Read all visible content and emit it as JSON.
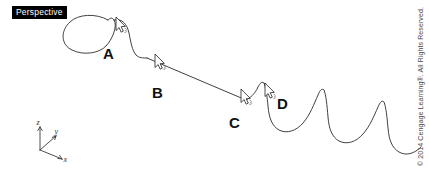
{
  "viewport": {
    "label": "Perspective",
    "background_color": "#ffffff",
    "stroke_color": "#2b2b2b",
    "label_background": "#000000",
    "label_text_color": "#ffffff"
  },
  "annotations": {
    "points": [
      {
        "id": "A",
        "label": "A",
        "x": 103,
        "y": 46,
        "cursor_x": 116,
        "cursor_y": 17,
        "cursor_dir": "up"
      },
      {
        "id": "B",
        "label": "B",
        "x": 152,
        "y": 85,
        "cursor_x": 155,
        "cursor_y": 54,
        "cursor_dir": "up"
      },
      {
        "id": "C",
        "label": "C",
        "x": 229,
        "y": 115,
        "cursor_x": 241,
        "cursor_y": 89,
        "cursor_dir": "up"
      },
      {
        "id": "D",
        "label": "D",
        "x": 277,
        "y": 96,
        "cursor_x": 265,
        "cursor_y": 83,
        "cursor_dir": "up"
      }
    ]
  },
  "axis_triad": {
    "origin_x": 40,
    "origin_y": 150,
    "labels": {
      "z": "z",
      "y": "y",
      "x": "x"
    }
  },
  "curve": {
    "description": "freeform spline with loop, straight descent and damped zigzag tail",
    "loop_path": "M 108 20 C 96 13 78 14 70 22 C 60 31 61 45 72 50 C 84 56 100 53 106 46",
    "crest_path": "M 106 46 C 112 40 118 26 114 20 C 112 17 110 18 108 20",
    "shoulder_path": "M 114 20 C 122 18 127 24 129 33 C 131 43 132 50 136 55 C 139 58 143 58 147 58",
    "descent_path": "M 147 58 L 246 100",
    "riser_path": "M 246 100 C 250 98 255 94 258 87 C 260 83 262 81 264 83",
    "tail_path": "M 264 83 C 266 88 267 96 268 106 C 269 118 272 126 279 130 C 287 134 296 131 303 123 C 310 115 314 104 318 95 C 320 90 322 88 324 90 C 326 95 327 105 328 117 C 329 129 332 137 339 141 C 347 145 356 142 363 134 C 370 126 374 116 378 107 C 380 102 382 100 384 102 C 386 107 387 117 388 128 C 389 140 392 148 399 152 C 406 156 414 154 421 147"
  },
  "copyright": {
    "text": "© 2014 Cengage Learning®. All Rights Reserved."
  }
}
